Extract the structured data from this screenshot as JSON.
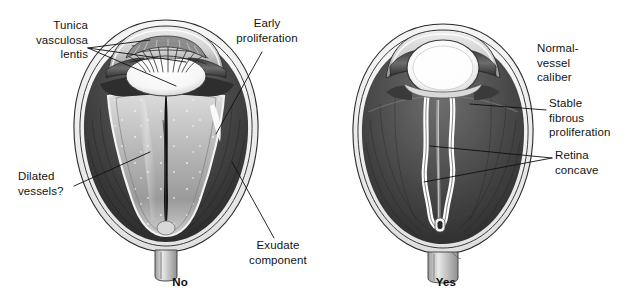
{
  "figure": {
    "background_color": "#ffffff",
    "ink_color": "#131313"
  },
  "panels": [
    {
      "id": "left",
      "caption": "No",
      "description": "Eye cross-section with funnel-shaped retinal detachment, exudate and dilated vessels"
    },
    {
      "id": "right",
      "caption": "Yes",
      "description": "Eye cross-section with narrow stable fibrous stalk and concave retina"
    }
  ],
  "annotations": {
    "tunica_vasculosa_lentis": "Tunica\nvasculosa\nlentis",
    "early_proliferation": "Early\nproliferation",
    "dilated_vessels": "Dilated\nvessels?",
    "exudate_component": "Exudate\ncomponent",
    "normal_vessel_caliber": "Normal-\nvessel\ncaliber",
    "stable_fibrous_proliferation": "Stable\nfibrous\nproliferation",
    "retina_concave": "Retina\nconcave"
  }
}
